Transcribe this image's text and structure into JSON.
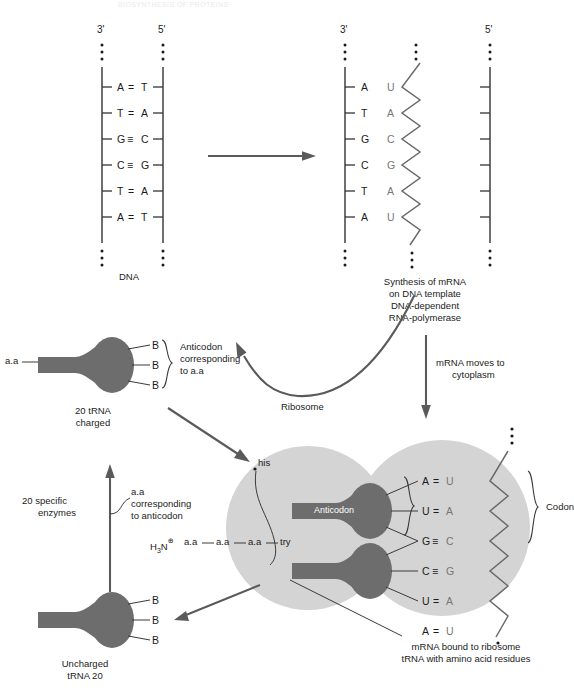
{
  "header": {
    "title": "BIOSYNTHESIS OF PROTEINS"
  },
  "dna_panel": {
    "label": "DNA",
    "left_end": "3'",
    "right_end": "5'",
    "pairs": [
      {
        "left": "A",
        "bond": "=",
        "right": "T"
      },
      {
        "left": "T",
        "bond": "=",
        "right": "A"
      },
      {
        "left": "G",
        "bond": "≡",
        "right": "C"
      },
      {
        "left": "C",
        "bond": "≡",
        "right": "G"
      },
      {
        "left": "T",
        "bond": "=",
        "right": "A"
      },
      {
        "left": "A",
        "bond": "=",
        "right": "T"
      }
    ]
  },
  "transcription_arrow": {
    "name": "transcription-arrow"
  },
  "mrna_panel": {
    "left_end": "3'",
    "right_end": "5'",
    "template_bases": [
      "A",
      "T",
      "G",
      "C",
      "T",
      "A"
    ],
    "mrna_bases": [
      "U",
      "A",
      "C",
      "G",
      "A",
      "U"
    ],
    "caption": [
      "Synthesis of mRNA",
      "on DNA template",
      "DNA-dependent",
      "RNA-polymerase"
    ]
  },
  "mrna_move_label": [
    "mRNA moves to",
    "cytoplasm"
  ],
  "charged_trna": {
    "amino_acid_label": "a.a",
    "bases": [
      "B",
      "B",
      "B"
    ],
    "anticodon_note": [
      "Anticodon",
      "corresponding",
      "to a.a"
    ],
    "caption": [
      "20 tRNA",
      "charged"
    ]
  },
  "enzymes": {
    "label": [
      "20 specific",
      "enzymes"
    ],
    "note": [
      "a.a",
      "corresponding",
      "to anticodon"
    ]
  },
  "ribosome": {
    "label": "Ribosome",
    "anticodon_label": "Anticodon",
    "codon_label": "Codon",
    "his_label": "his",
    "peptide": {
      "terminus": "H",
      "terminus_sub": "3",
      "terminus_n": "N",
      "charge": "⊕",
      "residues": [
        "a.a",
        "a.a",
        "a.a"
      ],
      "last": "try"
    },
    "pairs": [
      {
        "anticodon": "A",
        "bond": "=",
        "codon": "U"
      },
      {
        "anticodon": "U",
        "bond": "=",
        "codon": "A"
      },
      {
        "anticodon": "G",
        "bond": "≡",
        "codon": "C"
      },
      {
        "anticodon": "C",
        "bond": "≡",
        "codon": "G"
      },
      {
        "anticodon": "U",
        "bond": "=",
        "codon": "A"
      },
      {
        "anticodon": "A",
        "bond": "=",
        "codon": "U"
      }
    ],
    "caption": [
      "mRNA bound to ribosome",
      "tRNA with amino acid residues"
    ]
  },
  "uncharged_trna": {
    "bases": [
      "B",
      "B",
      "B"
    ],
    "caption": [
      "Uncharged",
      "tRNA 20"
    ]
  },
  "colors": {
    "ribosome_fill": "#d4d4d4",
    "trna_fill": "#6d6d6d",
    "arrow": "#5a5a5a",
    "rna_text": "#767676",
    "ink": "#1b1b1b"
  }
}
